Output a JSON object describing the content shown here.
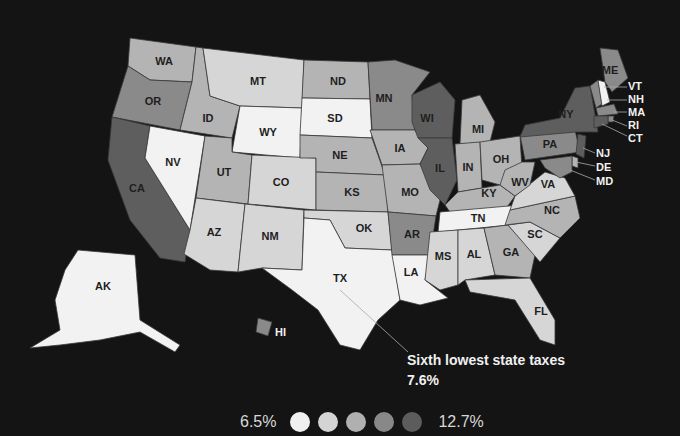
{
  "map": {
    "type": "choropleth",
    "subject": "State tax burden",
    "colors": {
      "background": "#141414",
      "bin1": "#f2f2f2",
      "bin2": "#d6d6d6",
      "bin3": "#b4b4b4",
      "bin4": "#8a8a8a",
      "bin5": "#5e5e5e"
    },
    "states": {
      "WA": {
        "label": "WA",
        "bin": 3
      },
      "OR": {
        "label": "OR",
        "bin": 4
      },
      "CA": {
        "label": "CA",
        "bin": 5
      },
      "ID": {
        "label": "ID",
        "bin": 3
      },
      "NV": {
        "label": "NV",
        "bin": 1
      },
      "MT": {
        "label": "MT",
        "bin": 2
      },
      "WY": {
        "label": "WY",
        "bin": 1
      },
      "UT": {
        "label": "UT",
        "bin": 3
      },
      "CO": {
        "label": "CO",
        "bin": 2
      },
      "AZ": {
        "label": "AZ",
        "bin": 2
      },
      "NM": {
        "label": "NM",
        "bin": 2
      },
      "ND": {
        "label": "ND",
        "bin": 3
      },
      "SD": {
        "label": "SD",
        "bin": 1
      },
      "NE": {
        "label": "NE",
        "bin": 3
      },
      "KS": {
        "label": "KS",
        "bin": 3
      },
      "OK": {
        "label": "OK",
        "bin": 2
      },
      "TX": {
        "label": "TX",
        "bin": 1
      },
      "MN": {
        "label": "MN",
        "bin": 4
      },
      "IA": {
        "label": "IA",
        "bin": 3
      },
      "MO": {
        "label": "MO",
        "bin": 3
      },
      "AR": {
        "label": "AR",
        "bin": 4
      },
      "LA": {
        "label": "LA",
        "bin": 1
      },
      "WI": {
        "label": "WI",
        "bin": 5
      },
      "IL": {
        "label": "IL",
        "bin": 5
      },
      "MI": {
        "label": "MI",
        "bin": 3
      },
      "IN": {
        "label": "IN",
        "bin": 3
      },
      "OH": {
        "label": "OH",
        "bin": 3
      },
      "KY": {
        "label": "KY",
        "bin": 3
      },
      "TN": {
        "label": "TN",
        "bin": 1
      },
      "MS": {
        "label": "MS",
        "bin": 2
      },
      "AL": {
        "label": "AL",
        "bin": 2
      },
      "GA": {
        "label": "GA",
        "bin": 3
      },
      "FL": {
        "label": "FL",
        "bin": 2
      },
      "SC": {
        "label": "SC",
        "bin": 2
      },
      "NC": {
        "label": "NC",
        "bin": 3
      },
      "VA": {
        "label": "VA",
        "bin": 2
      },
      "WV": {
        "label": "WV",
        "bin": 3
      },
      "PA": {
        "label": "PA",
        "bin": 4
      },
      "NY": {
        "label": "NY",
        "bin": 5
      },
      "ME": {
        "label": "ME",
        "bin": 4
      },
      "VT": {
        "label": "VT",
        "bin": 4
      },
      "NH": {
        "label": "NH",
        "bin": 1
      },
      "MA": {
        "label": "MA",
        "bin": 4
      },
      "RI": {
        "label": "RI",
        "bin": 4
      },
      "CT": {
        "label": "CT",
        "bin": 5
      },
      "NJ": {
        "label": "NJ",
        "bin": 5
      },
      "DE": {
        "label": "DE",
        "bin": 3
      },
      "MD": {
        "label": "MD",
        "bin": 4
      },
      "AK": {
        "label": "AK",
        "bin": 1
      },
      "HI": {
        "label": "HI",
        "bin": 4
      }
    },
    "callout": {
      "state": "TX",
      "text": "Sixth lowest state taxes",
      "value": "7.6%"
    },
    "legend": {
      "min_label": "6.5%",
      "max_label": "12.7%",
      "bins": 5
    }
  }
}
